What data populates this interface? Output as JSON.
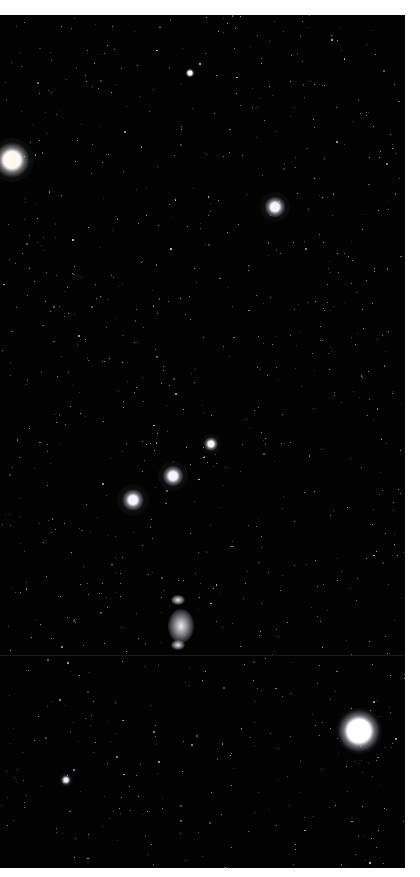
{
  "image": {
    "subject": "Orion constellation night sky",
    "background_color": "#020202",
    "frame": {
      "left": 0,
      "top": 15,
      "width": 405,
      "height": 853
    }
  },
  "bright_stars": [
    {
      "name": "betelgeuse",
      "x": 12,
      "y": 145,
      "core": 12,
      "glow": 44,
      "color": "#fff6ee"
    },
    {
      "name": "bellatrix",
      "x": 275,
      "y": 192,
      "core": 6,
      "glow": 30,
      "color": "#f2f4ff"
    },
    {
      "name": "mintaka",
      "x": 211,
      "y": 429,
      "core": 4,
      "glow": 20,
      "color": "#f4f4ff"
    },
    {
      "name": "alnilam",
      "x": 173,
      "y": 461,
      "core": 6,
      "glow": 30,
      "color": "#f4f4ff"
    },
    {
      "name": "alnitak",
      "x": 133,
      "y": 485,
      "core": 6,
      "glow": 32,
      "color": "#f4f4ff"
    },
    {
      "name": "rigel",
      "x": 359,
      "y": 716,
      "core": 16,
      "glow": 46,
      "color": "#ffffff"
    },
    {
      "name": "saiph",
      "x": 66,
      "y": 765,
      "core": 3,
      "glow": 14,
      "color": "#eef0ff"
    },
    {
      "name": "meissa",
      "x": 190,
      "y": 58,
      "core": 3,
      "glow": 10,
      "color": "#ffffff"
    }
  ],
  "nebula": [
    {
      "name": "orion-nebula",
      "x": 181,
      "y": 611,
      "w": 26,
      "h": 34
    },
    {
      "name": "nebula-upper",
      "x": 178,
      "y": 585,
      "w": 14,
      "h": 10
    },
    {
      "name": "nebula-lower",
      "x": 178,
      "y": 630,
      "w": 14,
      "h": 10
    }
  ],
  "seam_y": 640,
  "background_star_seed": 1337,
  "background_star_count": 900
}
